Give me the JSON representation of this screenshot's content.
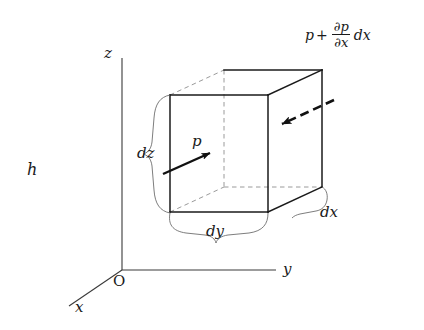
{
  "figure": {
    "background_color": "#ffffff",
    "line_color": "#1a1a1a",
    "hidden_line_color": "#8a8a8a",
    "brace_color": "#6e6e6e"
  },
  "axes": {
    "z_label": "z",
    "y_label": "y",
    "x_label": "x",
    "origin_label": "O"
  },
  "labels": {
    "depth_h": "h",
    "pressure": "p",
    "dz": "dz",
    "dy": "dy",
    "dx": "dx"
  },
  "formula": {
    "base": "p",
    "operator": "+",
    "numerator": "∂p",
    "denominator": "∂x",
    "differential": "dx",
    "full_text": "p + ∂p/∂x dx"
  },
  "geometry": {
    "front_face": {
      "x1": 170,
      "y1": 95,
      "x2": 268,
      "y2": 212
    },
    "depth_offset": {
      "dx": 54,
      "dy": -25
    },
    "pressure_arrow": {
      "x1": 163,
      "y1": 174,
      "x2": 212,
      "y2": 152
    },
    "opposing_arrow": {
      "x1": 334,
      "y1": 100,
      "x2": 279,
      "y2": 126
    }
  }
}
